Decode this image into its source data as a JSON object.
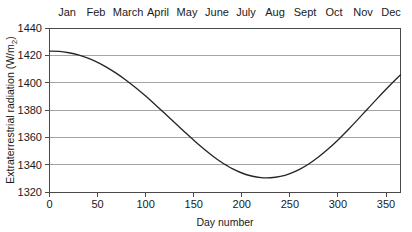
{
  "chart_data": {
    "type": "line",
    "title": "",
    "xlabel": "Day number",
    "ylabel": "Extraterrestrial radiation (W/m2)",
    "ylabel_parts": {
      "main": "Extraterrestrial radiation (W/m",
      "subscript": "2",
      "tail": ")"
    },
    "xlim": [
      0,
      365
    ],
    "ylim": [
      1320,
      1440
    ],
    "grid": "horizontal",
    "legend": "none",
    "x_ticks": [
      0,
      50,
      100,
      150,
      200,
      250,
      300,
      350
    ],
    "x_tick_labels": [
      "0",
      "50",
      "100",
      "150",
      "200",
      "250",
      "300",
      "350"
    ],
    "y_ticks": [
      1320,
      1340,
      1360,
      1380,
      1400,
      1420,
      1440
    ],
    "y_tick_labels": [
      "1320",
      "1340",
      "1360",
      "1380",
      "1400",
      "1420",
      "1440"
    ],
    "secondary_axis": {
      "position": "top",
      "labels": [
        "Jan",
        "Feb",
        "March",
        "April",
        "May",
        "June",
        "July",
        "Aug",
        "Sept",
        "Oct",
        "Nov",
        "Dec"
      ],
      "centers": [
        15,
        45,
        74,
        105,
        135,
        166,
        196,
        227,
        258,
        288,
        319,
        349
      ]
    },
    "series": [
      {
        "name": "Extraterrestrial radiation",
        "color": "#262626",
        "x": [
          0,
          10,
          20,
          30,
          40,
          50,
          60,
          70,
          80,
          90,
          100,
          110,
          120,
          130,
          140,
          150,
          160,
          170,
          180,
          183,
          190,
          200,
          210,
          220,
          230,
          240,
          250,
          260,
          270,
          280,
          290,
          300,
          310,
          320,
          330,
          340,
          350,
          360,
          365
        ],
        "y": [
          1423.1,
          1422.9,
          1421.9,
          1420.3,
          1417.9,
          1414.8,
          1411.0,
          1406.6,
          1401.6,
          1396.1,
          1390.2,
          1383.9,
          1377.4,
          1370.8,
          1364.3,
          1357.9,
          1351.8,
          1346.2,
          1341.2,
          1340.0,
          1337.1,
          1333.9,
          1331.7,
          1330.5,
          1330.4,
          1331.4,
          1333.5,
          1336.6,
          1340.7,
          1345.8,
          1351.6,
          1358.1,
          1365.2,
          1372.6,
          1380.2,
          1387.8,
          1395.2,
          1402.3,
          1405.6
        ]
      }
    ],
    "annotations": {
      "maximum": {
        "day": 0,
        "value": 1423
      },
      "minimum": {
        "day": 183,
        "value": 1330
      },
      "year_end": {
        "day": 365,
        "value": 1424
      }
    },
    "colors": {
      "curve": "#262626",
      "grid": "#9a9a9a",
      "axis": "#4a4a4a",
      "background": "#ffffff",
      "text": "#1a1a1a"
    }
  }
}
